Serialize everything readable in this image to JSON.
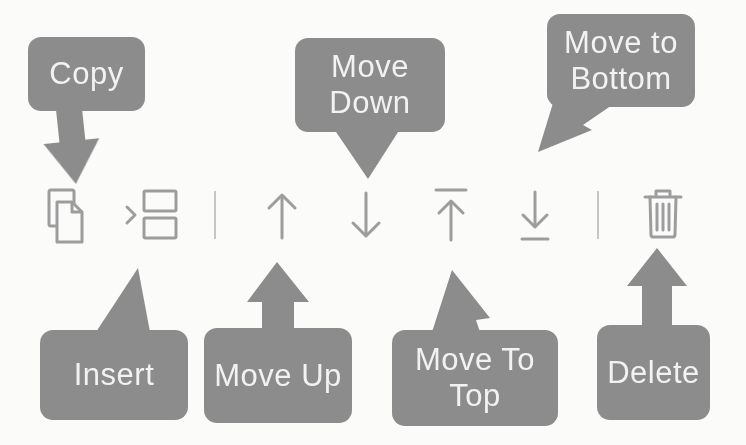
{
  "colors": {
    "background": "#fbfbfa",
    "bubble": "#8c8c8c",
    "bubble_text": "#f2f2f2",
    "icon": "#9d9d9d",
    "divider": "#c6c6c6"
  },
  "toolbar": {
    "items": [
      {
        "type": "button",
        "icon": "copy-icon",
        "action": "Copy"
      },
      {
        "type": "button",
        "icon": "insert-icon",
        "action": "Insert"
      },
      {
        "type": "divider"
      },
      {
        "type": "button",
        "icon": "arrow-up-icon",
        "action": "Move Up"
      },
      {
        "type": "button",
        "icon": "arrow-down-icon",
        "action": "Move Down"
      },
      {
        "type": "button",
        "icon": "move-to-top-icon",
        "action": "Move To Top"
      },
      {
        "type": "button",
        "icon": "move-to-bottom-icon",
        "action": "Move to Bottom"
      },
      {
        "type": "divider"
      },
      {
        "type": "button",
        "icon": "trash-icon",
        "action": "Delete"
      }
    ]
  },
  "callouts": {
    "copy": {
      "label": "Copy",
      "points_to": "copy-icon"
    },
    "move_down": {
      "label": "Move\nDown",
      "points_to": "arrow-down-icon"
    },
    "move_to_bottom": {
      "label": "Move to\nBottom",
      "points_to": "move-to-bottom-icon"
    },
    "insert": {
      "label": "Insert",
      "points_to": "insert-icon"
    },
    "move_up": {
      "label": "Move Up",
      "points_to": "arrow-up-icon"
    },
    "move_to_top": {
      "label": "Move To\nTop",
      "points_to": "move-to-top-icon"
    },
    "delete": {
      "label": "Delete",
      "points_to": "trash-icon"
    }
  }
}
